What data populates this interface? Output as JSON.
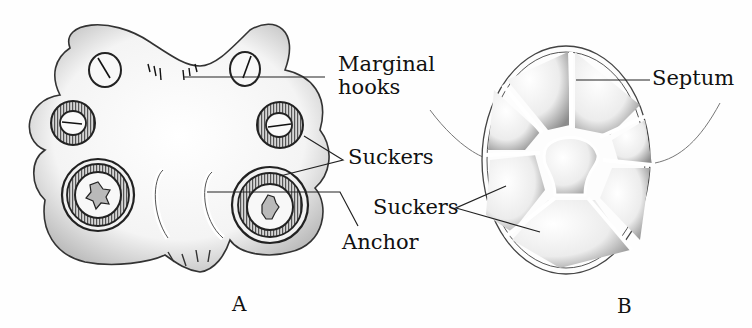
{
  "figure": {
    "panels": [
      {
        "id": "A",
        "label": "A",
        "subject": "opisthaptor with suckers, marginal hooks and anchors"
      },
      {
        "id": "B",
        "label": "B",
        "subject": "disc-shaped haptor divided by septa into suckers"
      }
    ],
    "labels": {
      "marginal_hooks_line1": "Marginal",
      "marginal_hooks_line2": "hooks",
      "suckers_a": "Suckers",
      "anchor": "Anchor",
      "septum": "Septum",
      "suckers_b": "Suckers"
    },
    "colors": {
      "ink": "#111111",
      "background": "#fefefe",
      "stipple": "#6a6a6a"
    }
  }
}
